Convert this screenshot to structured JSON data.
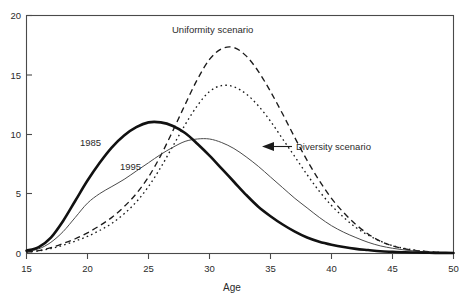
{
  "chart_data": {
    "type": "line",
    "title": "",
    "xlabel": "Age",
    "ylabel": "",
    "xlim": [
      15,
      50
    ],
    "ylim": [
      0,
      20
    ],
    "xticks": [
      15,
      20,
      25,
      30,
      35,
      40,
      45,
      50
    ],
    "yticks": [
      0,
      5,
      10,
      15,
      20
    ],
    "grid": false,
    "legend": "inline-annotations",
    "x": [
      15,
      16,
      17,
      18,
      19,
      20,
      21,
      22,
      23,
      24,
      25,
      26,
      27,
      28,
      29,
      30,
      31,
      32,
      33,
      34,
      35,
      36,
      37,
      38,
      39,
      40,
      41,
      42,
      43,
      44,
      45,
      46,
      47,
      48,
      49,
      50
    ],
    "series": [
      {
        "name": "1985",
        "style": "thick-solid",
        "values": [
          0.2,
          0.5,
          1.3,
          2.7,
          4.4,
          6.1,
          7.6,
          8.9,
          9.9,
          10.6,
          11.0,
          11.0,
          10.7,
          10.1,
          9.2,
          8.2,
          7.1,
          6.0,
          4.9,
          3.9,
          3.1,
          2.4,
          1.8,
          1.3,
          0.95,
          0.7,
          0.5,
          0.35,
          0.25,
          0.15,
          0.1,
          0.06,
          0.04,
          0.02,
          0.01,
          0.0
        ]
      },
      {
        "name": "1995",
        "style": "thin-solid",
        "values": [
          0.15,
          0.35,
          0.9,
          1.8,
          3.0,
          4.2,
          5.0,
          5.6,
          6.2,
          6.9,
          7.6,
          8.3,
          8.9,
          9.4,
          9.6,
          9.6,
          9.3,
          8.8,
          8.1,
          7.3,
          6.4,
          5.5,
          4.6,
          3.8,
          3.0,
          2.3,
          1.75,
          1.3,
          0.9,
          0.6,
          0.4,
          0.25,
          0.15,
          0.08,
          0.04,
          0.0
        ]
      },
      {
        "name": "Uniformity scenario",
        "style": "dashed",
        "values": [
          0.1,
          0.2,
          0.45,
          0.8,
          1.2,
          1.7,
          2.3,
          3.0,
          3.9,
          5.0,
          6.4,
          8.2,
          10.3,
          12.5,
          14.6,
          16.3,
          17.2,
          17.3,
          16.6,
          15.3,
          13.6,
          11.7,
          9.7,
          7.8,
          6.1,
          4.6,
          3.4,
          2.4,
          1.6,
          1.0,
          0.6,
          0.35,
          0.2,
          0.1,
          0.04,
          0.0
        ]
      },
      {
        "name": "Diversity scenario",
        "style": "dotted",
        "values": [
          0.08,
          0.18,
          0.38,
          0.65,
          1.0,
          1.4,
          1.9,
          2.5,
          3.3,
          4.3,
          5.6,
          7.2,
          9.0,
          10.8,
          12.4,
          13.6,
          14.1,
          14.0,
          13.4,
          12.4,
          11.1,
          9.6,
          8.1,
          6.6,
          5.2,
          4.0,
          3.0,
          2.15,
          1.5,
          1.0,
          0.62,
          0.38,
          0.21,
          0.1,
          0.04,
          0.0
        ]
      }
    ],
    "annotations": [
      {
        "text": "Uniformity scenario",
        "for": "Uniformity scenario"
      },
      {
        "text": "Diversity scenario",
        "for": "Diversity scenario"
      },
      {
        "text": "1985",
        "for": "1985"
      },
      {
        "text": "1995",
        "for": "1995"
      }
    ]
  },
  "axes": {
    "x_tick_labels": [
      "15",
      "20",
      "25",
      "30",
      "35",
      "40",
      "45",
      "50"
    ],
    "y_tick_labels": [
      "0",
      "5",
      "10",
      "15",
      "20"
    ],
    "x_axis_title": "Age"
  },
  "labels": {
    "uniformity": "Uniformity scenario",
    "diversity": "Diversity scenario",
    "year_1985": "1985",
    "year_1995": "1995"
  },
  "colors": {
    "background": "#ffffff",
    "axis": "#4a4a4a",
    "curve_1985": "#111111",
    "curve_1995": "#4b4b4b",
    "curve_uniformity": "#1b1b1b",
    "curve_diversity": "#1b1b1b",
    "text": "#2b2b2b"
  }
}
